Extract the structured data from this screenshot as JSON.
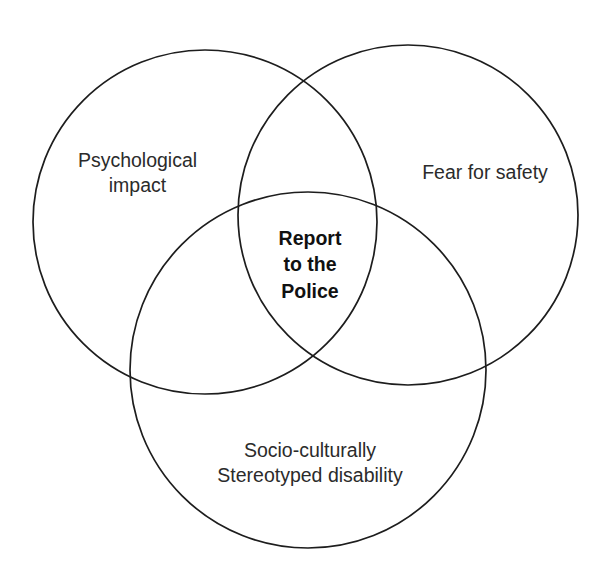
{
  "diagram": {
    "type": "venn",
    "set_count": 3,
    "background_color": "#ffffff",
    "stroke_color": "#1d1d1d",
    "text_color": "#2b2b2b",
    "center_text_color": "#111111",
    "sets": [
      {
        "id": "psychological-impact",
        "label_lines": [
          "Psychological",
          "impact"
        ],
        "line1": "Psychological",
        "line2": "impact",
        "position": "top-left",
        "center_x": 205,
        "center_y": 222,
        "radius": 172
      },
      {
        "id": "fear-for-safety",
        "label_lines": [
          "Fear for safety"
        ],
        "line1": "Fear for safety",
        "position": "top-right",
        "center_x": 408,
        "center_y": 215,
        "radius": 170
      },
      {
        "id": "socio-culturally-stereotyped-disability",
        "label_lines": [
          "Socio-culturally",
          "Stereotyped disability"
        ],
        "line1": "Socio-culturally",
        "line2": "Stereotyped disability",
        "position": "bottom",
        "center_x": 308,
        "center_y": 370,
        "radius": 178
      }
    ],
    "intersection": {
      "id": "report-to-the-police",
      "label_lines": [
        "Report",
        "to the",
        "Police"
      ],
      "line1": "Report",
      "line2": "to the",
      "line3": "Police",
      "bold": true
    }
  }
}
